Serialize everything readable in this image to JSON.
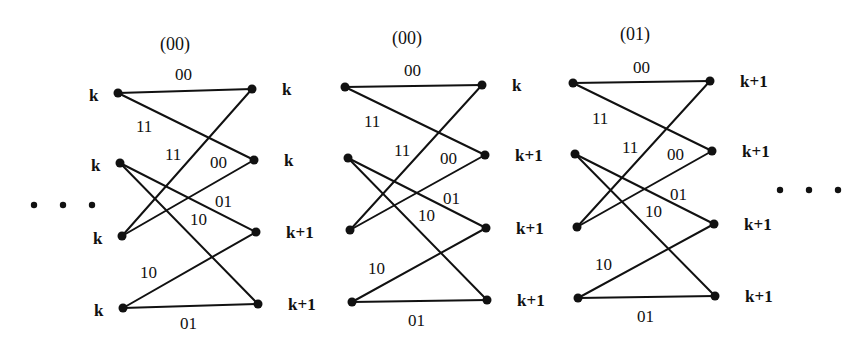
{
  "diagram": {
    "type": "trellis-butterfly",
    "colors": {
      "ink": "#111111",
      "background": "#ffffff"
    },
    "ellipsis_left": {
      "symbol": "• • •",
      "x": 34,
      "y": 205,
      "count": 3
    },
    "ellipsis_right": {
      "symbol": "• • •",
      "x": 780,
      "y": 190,
      "count": 3
    },
    "stages": [
      {
        "header": "(00)",
        "header_pos": [
          160,
          50
        ],
        "left_nodes": [
          [
            118,
            93
          ],
          [
            120,
            163
          ],
          [
            122,
            236
          ],
          [
            123,
            308
          ]
        ],
        "right_nodes": [
          [
            252,
            89
          ],
          [
            254,
            160
          ],
          [
            256,
            232
          ],
          [
            258,
            304
          ]
        ],
        "left_labels": [
          "k",
          "k",
          "k",
          "k"
        ],
        "right_labels": [
          "k",
          "k",
          "k+1",
          "k+1"
        ],
        "edges": [
          {
            "from": 0,
            "to": 0,
            "label": "00",
            "lx": 175,
            "ly": 80
          },
          {
            "from": 0,
            "to": 1,
            "label": "11",
            "lx": 136,
            "ly": 132
          },
          {
            "from": 2,
            "to": 0,
            "label": "11",
            "lx": 165,
            "ly": 160
          },
          {
            "from": 2,
            "to": 1,
            "label": "00",
            "lx": 210,
            "ly": 168
          },
          {
            "from": 1,
            "to": 2,
            "label": "01",
            "lx": 215,
            "ly": 207
          },
          {
            "from": 1,
            "to": 3,
            "label": "10",
            "lx": 190,
            "ly": 225
          },
          {
            "from": 3,
            "to": 2,
            "label": "10",
            "lx": 140,
            "ly": 278
          },
          {
            "from": 3,
            "to": 3,
            "label": "01",
            "lx": 180,
            "ly": 329
          }
        ]
      },
      {
        "header": "(00)",
        "header_pos": [
          392,
          44
        ],
        "left_nodes": [
          [
            345,
            87
          ],
          [
            348,
            158
          ],
          [
            350,
            230
          ],
          [
            352,
            302
          ]
        ],
        "right_nodes": [
          [
            482,
            85
          ],
          [
            485,
            155
          ],
          [
            486,
            228
          ],
          [
            487,
            300
          ]
        ],
        "left_labels": [],
        "right_labels": [
          "k",
          "k+1",
          "k+1",
          "k+1"
        ],
        "edges": [
          {
            "from": 0,
            "to": 0,
            "label": "00",
            "lx": 404,
            "ly": 76
          },
          {
            "from": 0,
            "to": 1,
            "label": "11",
            "lx": 364,
            "ly": 127
          },
          {
            "from": 2,
            "to": 0,
            "label": "11",
            "lx": 394,
            "ly": 156
          },
          {
            "from": 2,
            "to": 1,
            "label": "00",
            "lx": 440,
            "ly": 164
          },
          {
            "from": 1,
            "to": 2,
            "label": "01",
            "lx": 443,
            "ly": 204
          },
          {
            "from": 1,
            "to": 3,
            "label": "10",
            "lx": 418,
            "ly": 221
          },
          {
            "from": 3,
            "to": 2,
            "label": "10",
            "lx": 368,
            "ly": 274
          },
          {
            "from": 3,
            "to": 3,
            "label": "01",
            "lx": 408,
            "ly": 326
          }
        ]
      },
      {
        "header": "(01)",
        "header_pos": [
          620,
          40
        ],
        "left_nodes": [
          [
            573,
            83
          ],
          [
            575,
            154
          ],
          [
            577,
            227
          ],
          [
            578,
            298
          ]
        ],
        "right_nodes": [
          [
            710,
            81
          ],
          [
            712,
            151
          ],
          [
            714,
            224
          ],
          [
            715,
            296
          ]
        ],
        "left_labels": [],
        "right_labels": [
          "k+1",
          "k+1",
          "k+1",
          "k+1"
        ],
        "edges": [
          {
            "from": 0,
            "to": 0,
            "label": "00",
            "lx": 633,
            "ly": 73
          },
          {
            "from": 0,
            "to": 1,
            "label": "11",
            "lx": 592,
            "ly": 124
          },
          {
            "from": 2,
            "to": 0,
            "label": "11",
            "lx": 622,
            "ly": 153
          },
          {
            "from": 2,
            "to": 1,
            "label": "00",
            "lx": 667,
            "ly": 160
          },
          {
            "from": 1,
            "to": 2,
            "label": "01",
            "lx": 670,
            "ly": 200
          },
          {
            "from": 1,
            "to": 3,
            "label": "10",
            "lx": 645,
            "ly": 217
          },
          {
            "from": 3,
            "to": 2,
            "label": "10",
            "lx": 595,
            "ly": 270
          },
          {
            "from": 3,
            "to": 3,
            "label": "01",
            "lx": 637,
            "ly": 322
          }
        ]
      }
    ]
  }
}
